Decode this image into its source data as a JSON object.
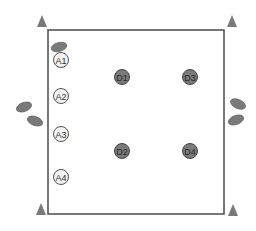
{
  "diagram": {
    "colors": {
      "frame": "#555555",
      "marker": "#7a7a7a",
      "seat_fill": "#f2f2f2",
      "seat_stroke": "#555555",
      "node_fill": "#7a7a7a",
      "node_stroke": "#444444",
      "label_dark": "#333333",
      "label_on_node": "#2a2a2a"
    },
    "corner_markers": [
      {
        "id": "top-left"
      },
      {
        "id": "top-right"
      },
      {
        "id": "bottom-left"
      },
      {
        "id": "bottom-right"
      }
    ],
    "a_seats": [
      {
        "label": "A1"
      },
      {
        "label": "A2"
      },
      {
        "label": "A3"
      },
      {
        "label": "A4"
      }
    ],
    "d_nodes": [
      {
        "label": "D1"
      },
      {
        "label": "D2"
      },
      {
        "label": "D3"
      },
      {
        "label": "D4"
      }
    ],
    "ovals": [
      {
        "id": "top-left-oval"
      },
      {
        "id": "left-oval-1"
      },
      {
        "id": "left-oval-2"
      },
      {
        "id": "right-oval-1"
      },
      {
        "id": "right-oval-2"
      }
    ]
  }
}
